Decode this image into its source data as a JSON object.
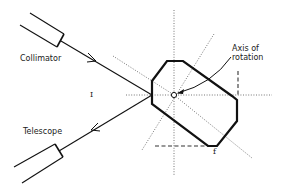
{
  "diagram": {
    "type": "optical goniometer / prism reflection schematic",
    "labels": {
      "collimator": "Collimator",
      "telescope": "Telescope",
      "axis": "Axis of\nrotation",
      "axis_line1": "Axis of",
      "axis_line2": "rotation",
      "incidence": "I",
      "face": "f"
    },
    "colors": {
      "ink": "#111111",
      "dotted": "#555555",
      "background": "#ffffff"
    }
  }
}
